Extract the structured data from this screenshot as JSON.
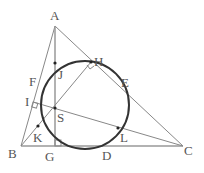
{
  "diagram": {
    "labels": {
      "A": "A",
      "B": "B",
      "C": "C",
      "D": "D",
      "E": "E",
      "F": "F",
      "G": "G",
      "H": "H",
      "I": "I",
      "J": "J",
      "K": "K",
      "L": "L",
      "S": "S"
    },
    "colors": {
      "lines": "#777777",
      "circle": "#333333",
      "text": "#555555"
    }
  }
}
